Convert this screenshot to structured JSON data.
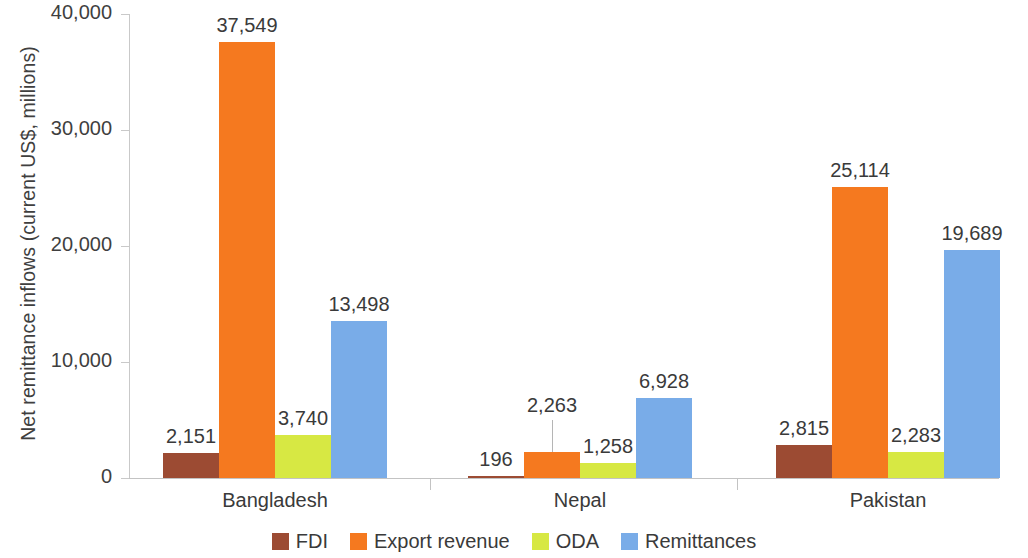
{
  "chart_data": {
    "type": "bar",
    "title": "",
    "xlabel": "",
    "ylabel": "Net remittance inflows (current US$, millions)",
    "ylim": [
      0,
      40000
    ],
    "ytick_labels": [
      "40,000",
      "30,000",
      "20,000",
      "10,000",
      "0"
    ],
    "ytick_values": [
      40000,
      30000,
      20000,
      10000,
      0
    ],
    "grid": false,
    "legend_position": "bottom",
    "categories": [
      "Bangladesh",
      "Nepal",
      "Pakistan"
    ],
    "series": [
      {
        "name": "FDI",
        "color": "#9c4b33",
        "values": [
          2151,
          196,
          2815
        ],
        "labels": [
          "2,151",
          "196",
          "2,815"
        ]
      },
      {
        "name": "Export revenue",
        "color": "#f5791f",
        "values": [
          37549,
          2263,
          25114
        ],
        "labels": [
          "37,549",
          "2,263",
          "25,114"
        ]
      },
      {
        "name": "ODA",
        "color": "#d7e843",
        "values": [
          3740,
          1258,
          2283
        ],
        "labels": [
          "3,740",
          "1,258",
          "2,283"
        ]
      },
      {
        "name": "Remittances",
        "color": "#79ace8",
        "values": [
          13498,
          6928,
          19689
        ],
        "labels": [
          "13,498",
          "6,928",
          "19,689"
        ]
      }
    ]
  },
  "axis": {
    "y_title": "Net remittance inflows (current US$, millions)",
    "ticks": [
      {
        "label": "40,000"
      },
      {
        "label": "30,000"
      },
      {
        "label": "20,000"
      },
      {
        "label": "10,000"
      },
      {
        "label": "0"
      }
    ]
  },
  "categories": [
    {
      "label": "Bangladesh"
    },
    {
      "label": "Nepal"
    },
    {
      "label": "Pakistan"
    }
  ],
  "legend": {
    "items": [
      {
        "label": "FDI",
        "color": "#9c4b33"
      },
      {
        "label": "Export revenue",
        "color": "#f5791f"
      },
      {
        "label": "ODA",
        "color": "#d7e843"
      },
      {
        "label": "Remittances",
        "color": "#79ace8"
      }
    ]
  }
}
